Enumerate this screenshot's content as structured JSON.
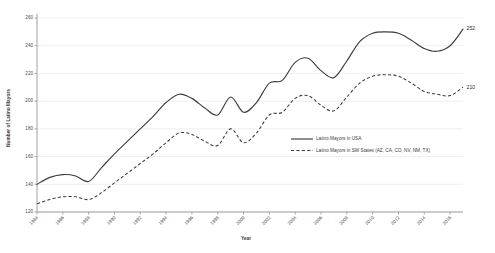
{
  "chart_data": {
    "type": "line",
    "title": "",
    "xlabel": "Year",
    "ylabel": "Number of Latino Mayors",
    "ylim": [
      120,
      260
    ],
    "yticks": [
      120,
      140,
      160,
      180,
      200,
      220,
      240,
      260
    ],
    "xlim": [
      1984,
      2017
    ],
    "grid": true,
    "legend_position": "inside-right",
    "categories": [
      1984,
      1985,
      1986,
      1987,
      1988,
      1989,
      1990,
      1991,
      1992,
      1993,
      1994,
      1995,
      1996,
      1997,
      1998,
      1999,
      2000,
      2001,
      2002,
      2003,
      2004,
      2005,
      2006,
      2007,
      2008,
      2009,
      2010,
      2011,
      2012,
      2013,
      2014,
      2015,
      2016,
      2017
    ],
    "xtick_labels": [
      "1984",
      "1986",
      "1988",
      "1990",
      "1992",
      "1994",
      "1996",
      "1998",
      "2000",
      "2002",
      "2004",
      "2006",
      "2008",
      "2010",
      "2012",
      "2014",
      "2016"
    ],
    "xticks": [
      1984,
      1986,
      1988,
      1990,
      1992,
      1994,
      1996,
      1998,
      2000,
      2002,
      2004,
      2006,
      2008,
      2010,
      2012,
      2014,
      2016
    ],
    "series": [
      {
        "name": "Latino Mayors in USA",
        "style": "solid",
        "color": "#3d3d3d",
        "end_label": "252",
        "values": [
          140,
          145,
          147,
          146,
          142,
          152,
          162,
          171,
          180,
          189,
          199,
          205,
          202,
          195,
          190,
          203,
          192,
          199,
          213,
          215,
          228,
          231,
          222,
          217,
          229,
          243,
          249,
          250,
          249,
          244,
          238,
          236,
          240,
          252
        ]
      },
      {
        "name": "Latino Mayors in SW States (AZ, CA, CO, NV, NM, TX)",
        "style": "dashed",
        "color": "#3d3d3d",
        "end_label": "210",
        "values": [
          126,
          129,
          131,
          131,
          129,
          134,
          141,
          148,
          155,
          162,
          170,
          177,
          176,
          171,
          168,
          180,
          170,
          177,
          190,
          192,
          202,
          204,
          197,
          193,
          203,
          213,
          218,
          219,
          218,
          213,
          207,
          205,
          204,
          210
        ]
      }
    ]
  },
  "axis": {
    "y_title": "Number of Latino Mayors",
    "x_title": "Year"
  },
  "legend": {
    "items": [
      {
        "label": "Latino Mayors in USA",
        "style": "solid"
      },
      {
        "label": "Latino Mayors in SW States (AZ, CA, CO, NV, NM, TX)",
        "style": "dashed"
      }
    ]
  },
  "colors": {
    "line": "#3d3d3d",
    "grid": "#e6e6e6",
    "axis": "#8a8a8a",
    "text": "#3a3a3a",
    "background": "#ffffff"
  }
}
